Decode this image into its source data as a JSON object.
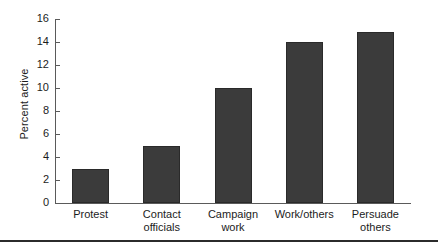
{
  "chart_data": {
    "type": "bar",
    "title": "",
    "subtitle": "",
    "xlabel": "",
    "ylabel": "Percent active",
    "categories": [
      "Protest",
      "Contact officials",
      "Campaign work",
      "Work/others",
      "Persuade others"
    ],
    "category_lines": [
      [
        "Protest"
      ],
      [
        "Contact",
        "officials"
      ],
      [
        "Campaign",
        "work"
      ],
      [
        "Work/others"
      ],
      [
        "Persuade",
        "others"
      ]
    ],
    "values": [
      3,
      5,
      10,
      14,
      14.9
    ],
    "ylim": [
      0,
      16
    ],
    "yticks": [
      0,
      2,
      4,
      6,
      8,
      10,
      12,
      14,
      16
    ],
    "ytick_labels": [
      "0",
      "2",
      "4",
      "6",
      "8",
      "10",
      "12",
      "14",
      "16"
    ],
    "grid": false,
    "legend": null,
    "bar_color": "#3b3b3b",
    "bar_edge_color": "#2a2a2a",
    "axis_color": "#5a5a5a",
    "background": "#ffffff"
  }
}
